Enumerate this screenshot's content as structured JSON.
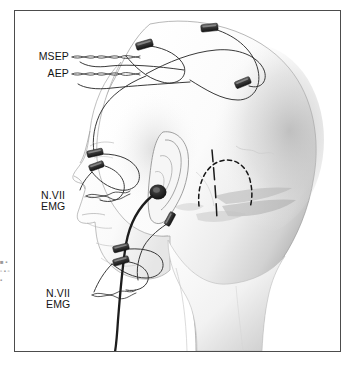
{
  "figure": {
    "domain_subject": "intraoperative-neurophysiologic-monitoring-head-diagram",
    "view": "lateral view of head and neck, facing left",
    "frame": {
      "border_color": "#4c4c4c",
      "background_color": "#ffffff"
    }
  },
  "labels": [
    {
      "id": "msep",
      "text": "MSEP",
      "align": "right",
      "meaning": "median somatosensory evoked potential scalp electrodes",
      "leader": "braided twisted-pair wire to vertex scalp electrodes"
    },
    {
      "id": "aep",
      "text": "AEP",
      "align": "right",
      "meaning": "auditory evoked potential electrodes and ear insert",
      "leader": "braided twisted-pair wire to scalp and ear"
    },
    {
      "id": "nvii_upper",
      "text": "N.VII\nEMG",
      "align": "left",
      "meaning": "cranial nerve VII electromyography, orbicularis oculi",
      "leader": "braided twisted-pair wire to periorbital electrodes"
    },
    {
      "id": "nvii_lower",
      "text": "N.VII\nEMG",
      "align": "left",
      "meaning": "cranial nerve VII electromyography, orbicularis oris",
      "leader": "braided twisted-pair wire to perioral electrodes"
    }
  ],
  "electrodes": [
    {
      "id": "scalp-vertex-anterior",
      "site": "anterior vertex scalp",
      "x": 144,
      "y": 45
    },
    {
      "id": "scalp-vertex-posterior",
      "site": "posterior vertex scalp",
      "x": 209,
      "y": 28
    },
    {
      "id": "scalp-parietal",
      "site": "parietal scalp",
      "x": 243,
      "y": 83
    },
    {
      "id": "periorbital-upper",
      "site": "supraorbital / brow",
      "x": 95,
      "y": 153
    },
    {
      "id": "periorbital-lower",
      "site": "infraorbital / lateral canthus",
      "x": 97,
      "y": 165
    },
    {
      "id": "perioral-upper",
      "site": "upper lip, orbicularis oris",
      "x": 121,
      "y": 248
    },
    {
      "id": "perioral-lower",
      "site": "lower cheek, orbicularis oris",
      "x": 121,
      "y": 261
    },
    {
      "id": "preauricular",
      "site": "preauricular / tragus",
      "x": 170,
      "y": 218
    }
  ],
  "ear_insert": {
    "id": "aep-ear-insert-transducer",
    "site": "external auditory canal",
    "tube": "dark cable routed inferiorly past the mandible and out of frame"
  },
  "surgical_markings": {
    "craniotomy_outline": {
      "style": "dashed",
      "site": "retrosigmoid / retromastoid",
      "shape": "semicircular flap outline behind the ear"
    },
    "incision_line": {
      "style": "solid",
      "orientation": "vertical",
      "site": "postauricular, crossing the craniotomy outline"
    }
  },
  "margin_caption": {
    "text": "■\n▪\n▫\n▪\n▫\n▪",
    "note": "clipped fragments of adjacent page text at the left edge"
  }
}
